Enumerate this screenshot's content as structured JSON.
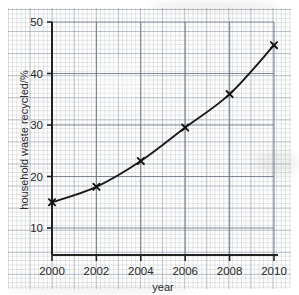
{
  "chart_data": {
    "type": "line",
    "title": "",
    "xlabel": "year",
    "ylabel": "household waste recycled/%",
    "x": [
      2000,
      2002,
      2004,
      2006,
      2008,
      2010
    ],
    "values": [
      15,
      18,
      23,
      29.5,
      36,
      45.5
    ],
    "series": [
      {
        "name": "household waste recycled",
        "x": [
          2000,
          2002,
          2004,
          2006,
          2008,
          2010
        ],
        "values": [
          15,
          18,
          23,
          29.5,
          36,
          45.5
        ]
      }
    ],
    "xlim": [
      2000,
      2010
    ],
    "ylim": [
      5,
      50
    ],
    "xticks": [
      "2000",
      "2002",
      "2004",
      "2006",
      "2008",
      "2010"
    ],
    "yticks": [
      "10",
      "20",
      "30",
      "40",
      "50"
    ],
    "ytick_values": [
      10,
      20,
      30,
      40,
      50
    ],
    "grid": true,
    "grid_style": "graph-paper",
    "legend": "none",
    "marker": "x",
    "line_color": "#1a1a1a",
    "marker_color": "#111111",
    "background_color": "#fdfdfc",
    "grid_color": "#7a8296"
  },
  "axes": {
    "y_title": "household waste recycled/%",
    "x_title": "year",
    "y_tick_labels": [
      "50",
      "40",
      "30",
      "20",
      "10"
    ],
    "x_tick_labels": [
      "2000",
      "2002",
      "2004",
      "2006",
      "2008",
      "2010"
    ]
  }
}
